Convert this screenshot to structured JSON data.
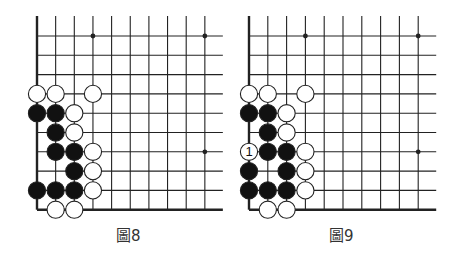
{
  "colors": {
    "line": "#222222",
    "black_stone": "#111111",
    "white_stone": "#ffffff",
    "stone_outline": "#222222",
    "background": "#ffffff"
  },
  "diagrams": [
    {
      "caption": "圖8",
      "origin_x": 37,
      "origin_y": 36,
      "spacing_x": 18.65,
      "spacing_y": 19.3,
      "columns": 10,
      "extend_right": 18,
      "star_points": [
        [
          3,
          0
        ],
        [
          9,
          0
        ],
        [
          9,
          6
        ]
      ],
      "stones": [
        {
          "c": 0,
          "r": 3,
          "color": "W"
        },
        {
          "c": 1,
          "r": 3,
          "color": "W"
        },
        {
          "c": 3,
          "r": 3,
          "color": "W"
        },
        {
          "c": 0,
          "r": 4,
          "color": "B"
        },
        {
          "c": 1,
          "r": 4,
          "color": "B"
        },
        {
          "c": 2,
          "r": 4,
          "color": "W"
        },
        {
          "c": 1,
          "r": 5,
          "color": "B"
        },
        {
          "c": 2,
          "r": 5,
          "color": "W"
        },
        {
          "c": 1,
          "r": 6,
          "color": "B"
        },
        {
          "c": 2,
          "r": 6,
          "color": "B"
        },
        {
          "c": 3,
          "r": 6,
          "color": "W"
        },
        {
          "c": 2,
          "r": 7,
          "color": "B"
        },
        {
          "c": 3,
          "r": 7,
          "color": "W"
        },
        {
          "c": 0,
          "r": 8,
          "color": "B"
        },
        {
          "c": 1,
          "r": 8,
          "color": "B"
        },
        {
          "c": 2,
          "r": 8,
          "color": "B"
        },
        {
          "c": 3,
          "r": 8,
          "color": "W"
        },
        {
          "c": 1,
          "r": 9,
          "color": "W"
        },
        {
          "c": 2,
          "r": 9,
          "color": "W"
        }
      ]
    },
    {
      "caption": "圖9",
      "origin_x": 249,
      "origin_y": 36,
      "spacing_x": 18.8,
      "spacing_y": 19.3,
      "columns": 10,
      "extend_right": 18,
      "star_points": [
        [
          3,
          0
        ],
        [
          9,
          0
        ],
        [
          9,
          6
        ]
      ],
      "stones": [
        {
          "c": 0,
          "r": 3,
          "color": "W"
        },
        {
          "c": 1,
          "r": 3,
          "color": "W"
        },
        {
          "c": 3,
          "r": 3,
          "color": "W"
        },
        {
          "c": 0,
          "r": 4,
          "color": "B"
        },
        {
          "c": 1,
          "r": 4,
          "color": "B"
        },
        {
          "c": 2,
          "r": 4,
          "color": "W"
        },
        {
          "c": 1,
          "r": 5,
          "color": "B"
        },
        {
          "c": 2,
          "r": 5,
          "color": "W"
        },
        {
          "c": 0,
          "r": 6,
          "color": "W",
          "label": "1"
        },
        {
          "c": 1,
          "r": 6,
          "color": "B"
        },
        {
          "c": 2,
          "r": 6,
          "color": "B"
        },
        {
          "c": 3,
          "r": 6,
          "color": "W"
        },
        {
          "c": 0,
          "r": 7,
          "color": "B"
        },
        {
          "c": 2,
          "r": 7,
          "color": "B"
        },
        {
          "c": 3,
          "r": 7,
          "color": "W"
        },
        {
          "c": 0,
          "r": 8,
          "color": "B"
        },
        {
          "c": 1,
          "r": 8,
          "color": "B"
        },
        {
          "c": 2,
          "r": 8,
          "color": "B"
        },
        {
          "c": 3,
          "r": 8,
          "color": "W"
        },
        {
          "c": 1,
          "r": 9,
          "color": "W"
        },
        {
          "c": 2,
          "r": 9,
          "color": "W"
        }
      ]
    }
  ]
}
